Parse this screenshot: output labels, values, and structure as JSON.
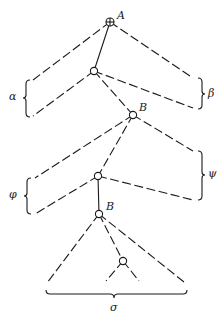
{
  "diagram": {
    "type": "tree",
    "nodes": [
      {
        "id": "A",
        "label": "A",
        "root": true,
        "x": 110,
        "y": 22
      },
      {
        "id": "n1",
        "label": "",
        "x": 94,
        "y": 71
      },
      {
        "id": "B1",
        "label": "B",
        "x": 133,
        "y": 115
      },
      {
        "id": "n2",
        "label": "",
        "x": 98,
        "y": 176
      },
      {
        "id": "B2",
        "label": "B",
        "x": 99,
        "y": 214
      },
      {
        "id": "n3",
        "label": "",
        "x": 123,
        "y": 261
      }
    ],
    "braces": [
      {
        "id": "alpha",
        "label": "α",
        "side": "left"
      },
      {
        "id": "beta",
        "label": "β",
        "side": "right"
      },
      {
        "id": "phi",
        "label": "φ",
        "side": "left"
      },
      {
        "id": "psi",
        "label": "ψ",
        "side": "right"
      },
      {
        "id": "sigma",
        "label": "σ",
        "side": "bottom"
      }
    ],
    "labels": {
      "A": "A",
      "B_upper": "B",
      "B_lower": "B",
      "alpha": "α",
      "beta": "β",
      "phi": "φ",
      "psi": "ψ",
      "sigma": "σ"
    }
  }
}
